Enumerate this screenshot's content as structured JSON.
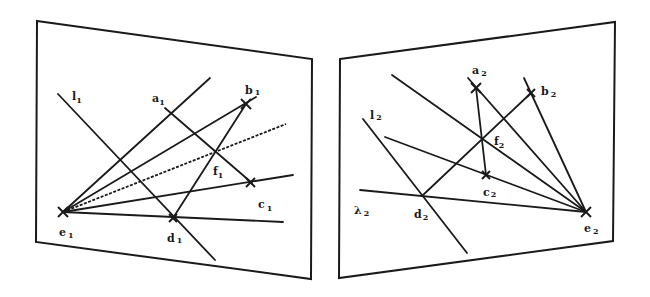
{
  "figure": {
    "left_view": {
      "name": "image-1",
      "labels": {
        "l": {
          "base": "l",
          "sub": "1"
        },
        "a": {
          "base": "a",
          "sub": "1"
        },
        "b": {
          "base": "b",
          "sub": "1"
        },
        "c": {
          "base": "c",
          "sub": "1"
        },
        "d": {
          "base": "d",
          "sub": "1"
        },
        "e": {
          "base": "e",
          "sub": "1"
        },
        "f": {
          "base": "f",
          "sub": "1"
        }
      }
    },
    "right_view": {
      "name": "image-2",
      "labels": {
        "l": {
          "base": "l",
          "sub": "2"
        },
        "lambda": {
          "base": "λ",
          "sub": "2"
        },
        "a": {
          "base": "a",
          "sub": "2"
        },
        "b": {
          "base": "b",
          "sub": "2"
        },
        "c": {
          "base": "c",
          "sub": "2"
        },
        "d": {
          "base": "d",
          "sub": "2"
        },
        "e": {
          "base": "e",
          "sub": "2"
        },
        "f": {
          "base": "f",
          "sub": "2"
        }
      }
    },
    "colors": {
      "ink": "#1a1a1a",
      "background": "#ffffff"
    }
  }
}
